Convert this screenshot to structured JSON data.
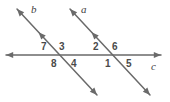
{
  "figure": {
    "stroke_color": "#6a6a6a",
    "label_color": "#4a4a4a",
    "background": "#ffffff"
  },
  "lines": [
    {
      "id": "line-b",
      "label": "b",
      "label_x": 31,
      "label_y": 4,
      "x1": 17,
      "y1": 9,
      "x2": 97,
      "y2": 95,
      "arrow_start": true,
      "arrow_end": true,
      "mid_arrow": true,
      "mid_arrow_t": 0.27
    },
    {
      "id": "line-a",
      "label": "a",
      "label_x": 81,
      "label_y": 4,
      "x1": 70,
      "y1": 9,
      "x2": 150,
      "y2": 95,
      "arrow_start": true,
      "arrow_end": true,
      "mid_arrow": true,
      "mid_arrow_t": 0.27
    },
    {
      "id": "line-c",
      "label": "c",
      "label_x": 151,
      "label_y": 61,
      "x1": 6,
      "y1": 55,
      "x2": 161,
      "y2": 55,
      "arrow_start": true,
      "arrow_end": true,
      "mid_arrow": false,
      "mid_arrow_t": 0
    }
  ],
  "intersections": [
    {
      "id": "intersection-b-c",
      "x": 57,
      "y": 55
    },
    {
      "id": "intersection-a-c",
      "x": 110,
      "y": 55
    }
  ],
  "angles": [
    {
      "id": "angle-7",
      "label": "7",
      "x": 41,
      "y": 42
    },
    {
      "id": "angle-3",
      "label": "3",
      "x": 59,
      "y": 42
    },
    {
      "id": "angle-2",
      "label": "2",
      "x": 93,
      "y": 42
    },
    {
      "id": "angle-6",
      "label": "6",
      "x": 112,
      "y": 42
    },
    {
      "id": "angle-8",
      "label": "8",
      "x": 51,
      "y": 59
    },
    {
      "id": "angle-4",
      "label": "4",
      "x": 71,
      "y": 59
    },
    {
      "id": "angle-1",
      "label": "1",
      "x": 105,
      "y": 59
    },
    {
      "id": "angle-5",
      "label": "5",
      "x": 126,
      "y": 59
    }
  ]
}
